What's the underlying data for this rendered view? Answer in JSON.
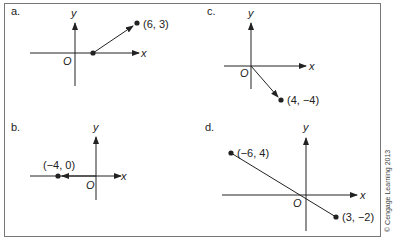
{
  "figure": {
    "copyright": "© Cengage Learning 2013",
    "panels": [
      {
        "id": "a",
        "label": "a.",
        "x_axis": "x",
        "y_axis": "y",
        "origin": "O",
        "point": "(6, 3)"
      },
      {
        "id": "b",
        "label": "b.",
        "x_axis": "x",
        "y_axis": "y",
        "origin": "O",
        "point": "(−4, 0)"
      },
      {
        "id": "c",
        "label": "c.",
        "x_axis": "x",
        "y_axis": "y",
        "origin": "O",
        "point": "(4, −4)"
      },
      {
        "id": "d",
        "label": "d.",
        "x_axis": "x",
        "y_axis": "y",
        "origin": "O",
        "point1": "(−6, 4)",
        "point2": "(3, −2)"
      }
    ]
  },
  "colors": {
    "ink": "#222222",
    "frame": "#777777",
    "background": "#ffffff"
  }
}
